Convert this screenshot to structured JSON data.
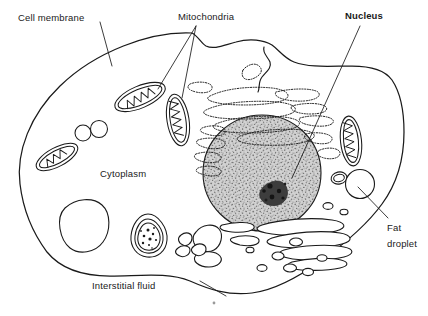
{
  "diagram": {
    "width": 428,
    "height": 316,
    "background_color": "#ffffff",
    "line_color": "#1a1a1a",
    "nucleus_fill_color": "#b9b9b9",
    "nucleolus_color": "#2b2b2b"
  },
  "labels": {
    "cell_membrane": "Cell membrane",
    "mitochondria": "Mitochondria",
    "nucleus": "Nucleus",
    "cytoplasm": "Cytoplasm",
    "fat_droplet_line1": "Fat",
    "fat_droplet_line2": "droplet",
    "interstitial_fluid": "Interstitial fluid"
  },
  "structures": [
    {
      "name": "cell-membrane",
      "count": 1,
      "description": "irregular rounded outer boundary of the cell"
    },
    {
      "name": "nucleus",
      "count": 1,
      "description": "large stippled grey sphere, right of centre"
    },
    {
      "name": "nucleolus",
      "count": 1,
      "description": "dark speckled mass inside the nucleus"
    },
    {
      "name": "mitochondrion",
      "count": 5,
      "description": "elongated ovals with internal zig-zag cristae"
    },
    {
      "name": "rough-endoplasmic-reticulum",
      "count": 1,
      "description": "stacked dotted cisternae above the nucleus"
    },
    {
      "name": "golgi-apparatus",
      "count": 1,
      "description": "stacked flattened sacs with vesicles below right of nucleus"
    },
    {
      "name": "lysosome",
      "count": 1,
      "description": "teardrop body with granular contents, lower left-centre"
    },
    {
      "name": "vacuole",
      "count": 1,
      "description": "large clear rounded vacuole, lower left"
    },
    {
      "name": "vesicle",
      "count": 2,
      "description": "small clear circles, upper left"
    },
    {
      "name": "fat-droplet",
      "count": 1,
      "description": "small clear circle near right edge of the cell"
    },
    {
      "name": "centriole-region",
      "count": 1,
      "description": "irregular clear bodies below the nucleus"
    }
  ],
  "leader_lines": [
    {
      "from": "cell_membrane",
      "to": "cell-membrane-outline"
    },
    {
      "from": "mitochondria",
      "to": "mitochondrion-upper-left"
    },
    {
      "from": "mitochondria",
      "to": "mitochondrion-centre"
    },
    {
      "from": "nucleus",
      "to": "nucleus"
    },
    {
      "from": "fat_droplet",
      "to": "fat-droplet"
    },
    {
      "from": "interstitial_fluid",
      "to": "exterior-space"
    }
  ]
}
